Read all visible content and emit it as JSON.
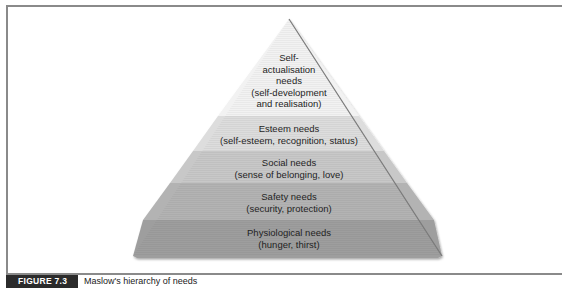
{
  "figure": {
    "number_label": "FIGURE 7.3",
    "title": "Maslow's hierarchy of needs"
  },
  "pyramid": {
    "levels": [
      {
        "name": "self-actualisation",
        "lines": [
          "Self-",
          "actualisation",
          "needs",
          "(self-development",
          "and realisation)"
        ],
        "color": "#f1f1f1"
      },
      {
        "name": "esteem",
        "lines": [
          "Esteem needs",
          "(self-esteem, recognition, status)"
        ],
        "color": "#dcdcdc"
      },
      {
        "name": "social",
        "lines": [
          "Social needs",
          "(sense of belonging, love)"
        ],
        "color": "#c6c6c6"
      },
      {
        "name": "safety",
        "lines": [
          "Safety needs",
          "(security, protection)"
        ],
        "color": "#b1b1b1"
      },
      {
        "name": "physiological",
        "lines": [
          "Physiological needs",
          "(hunger, thirst)"
        ],
        "color": "#9c9c9c"
      }
    ]
  }
}
